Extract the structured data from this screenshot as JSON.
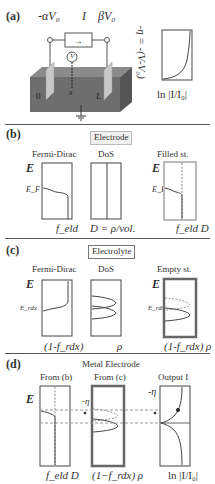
{
  "panel_a": {
    "label": "(a)",
    "left_voltage": "-αV₀",
    "current": "I",
    "right_voltage": "βV₀",
    "voltmeter": "V",
    "x_label": "x",
    "left_pos": "0",
    "right_pos": "L",
    "y_axis": "-η = -(V-V₀)",
    "x_axis": "ln |I/I₀|"
  },
  "panel_b": {
    "label": "(b)",
    "title": "Electrode",
    "plots": [
      {
        "title": "Fermi-Dirac",
        "y_label": "E",
        "level": "E_F",
        "x_label": "f_eld"
      },
      {
        "title": "DoS",
        "x_label": "D = ρ/vol."
      },
      {
        "title": "Filled st.",
        "y_label": "E",
        "level": "E_F",
        "x_label": "f_eld D"
      }
    ]
  },
  "panel_c": {
    "label": "(c)",
    "title": "Electrolyte",
    "plots": [
      {
        "title": "Fermi-Dirac",
        "y_label": "E",
        "level": "E_rdx",
        "x_label": "(1-f_rdx)"
      },
      {
        "title": "DoS",
        "x_label": "ρ"
      },
      {
        "title": "Empty st.",
        "y_label": "E",
        "level": "E_rdx",
        "x_label": "(1-f_rdx) ρ"
      }
    ]
  },
  "panel_d": {
    "label": "(d)",
    "title": "Metal Electrode",
    "plots": [
      {
        "title": "From (b)",
        "y_label": "E",
        "x_label": "f_eld D"
      },
      {
        "title": "From (c)",
        "marker": "-η",
        "x_label": "(1−f_rdx) ρ"
      },
      {
        "title": "Output I",
        "y_label": "-η",
        "x_label": "ln |I/I₀|"
      }
    ]
  },
  "colors": {
    "line": "#444444",
    "block": "#6e6e6e",
    "block_top": "#8a8a8a",
    "dashed": "#999999"
  }
}
